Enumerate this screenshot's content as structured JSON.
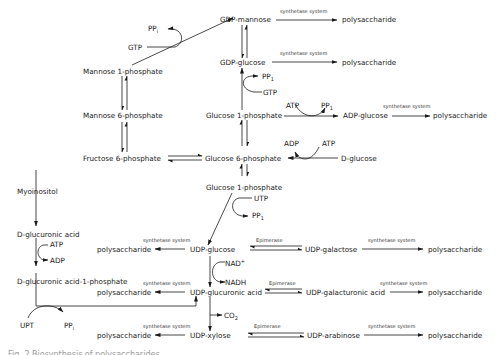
{
  "figure": {
    "caption": "Fig. 2 Biosynthesis of polysaccharides",
    "nodes": {
      "gdp_mannose": "GDP-mannose",
      "gdp_glucose": "GDP-glucose",
      "mannose_1p": "Mannose 1-phosphate",
      "mannose_6p": "Mannose 6-phosphate",
      "fructose_6p": "Fructose 6-phosphate",
      "glucose_1p_top": "Glucose 1-phosphate",
      "glucose_6p": "Glucose 6-phosphate",
      "glucose_1p_bottom": "Glucose 1-phosphate",
      "adp_glucose": "ADP-glucose",
      "d_glucose": "D-glucose",
      "myoinositol": "Myoinositol",
      "d_glucuronic_acid": "D-glucuronic acid",
      "d_glucuronic_acid_1p": "D-glucuronic acid-1-phosphate",
      "udp_glucose": "UDP-glucose",
      "udp_glucuronic_acid": "UDP-glucuronic acid",
      "udp_xylose": "UDP-xylose",
      "udp_galactose": "UDP-galactose",
      "udp_galacturonic_acid": "UDP-galacturonic acid",
      "udp_arabinose": "UDP-arabinose"
    },
    "products": {
      "polysaccharide": "polysaccharide"
    },
    "enzymes": {
      "synthetase": "synthetase system",
      "epimerase": "Epimerase"
    },
    "cofactors": {
      "pp": "PP",
      "pp_sub": "i",
      "pp1_sub": "1",
      "gtp": "GTP",
      "atp": "ATP",
      "adp": "ADP",
      "utp": "UTP",
      "upt": "UPT",
      "nad": "NAD",
      "nad_sup": "+",
      "nadh": "NADH",
      "co": "CO",
      "co_sub": "2"
    }
  }
}
